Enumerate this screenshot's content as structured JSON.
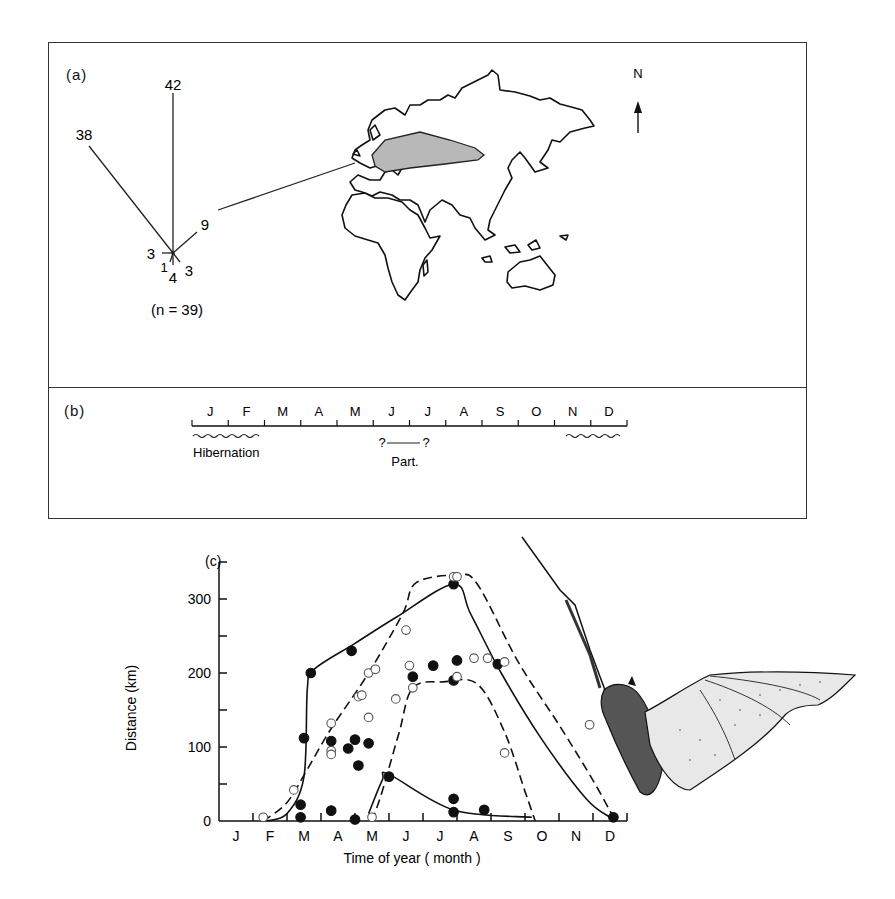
{
  "panel_a": {
    "label": "(a)",
    "rose": {
      "n_label": "(n = 39)",
      "rays": [
        {
          "direction": "N",
          "count": "42"
        },
        {
          "direction": "NW",
          "count": "38"
        },
        {
          "direction": "ENE",
          "count": "9"
        },
        {
          "direction": "W",
          "count": "3"
        },
        {
          "direction": "SSW",
          "count": "1"
        },
        {
          "direction": "S",
          "count": "4"
        },
        {
          "direction": "SE",
          "count": "3"
        }
      ]
    },
    "map": {
      "north_label": "N",
      "shaded_region": "range (Europe to Central Asia)"
    }
  },
  "panel_b": {
    "label": "(b)",
    "months": [
      "J",
      "F",
      "M",
      "A",
      "M",
      "J",
      "J",
      "A",
      "S",
      "O",
      "N",
      "D"
    ],
    "hibernation_label": "Hibernation",
    "parturition_label": "Part.",
    "parturition_marks": [
      "?",
      "?"
    ]
  },
  "panel_c": {
    "label": "(c)",
    "ylabel": "Distance (km)",
    "xlabel": "Time of year ( month )",
    "yticks": [
      "0",
      "100",
      "200",
      "300"
    ],
    "xticks": [
      "J",
      "F",
      "M",
      "A",
      "M",
      "J",
      "J",
      "A",
      "S",
      "O",
      "N",
      "D"
    ]
  },
  "chart_data": {
    "type": "scatter",
    "title": "(c)",
    "xlabel": "Time of year ( month )",
    "ylabel": "Distance (km)",
    "x_unit": "month (0 = start of Jan, 12 = end of Dec)",
    "xlim": [
      0,
      12
    ],
    "ylim": [
      0,
      350
    ],
    "categories": [
      "J",
      "F",
      "M",
      "A",
      "M",
      "J",
      "J",
      "A",
      "S",
      "O",
      "N",
      "D"
    ],
    "grid": false,
    "legend": "none",
    "series": [
      {
        "name": "filled circles",
        "marker": "filled",
        "points": [
          [
            2.7,
            200
          ],
          [
            2.5,
            112
          ],
          [
            2.4,
            22
          ],
          [
            2.4,
            5
          ],
          [
            3.3,
            108
          ],
          [
            3.3,
            14
          ],
          [
            3.9,
            230
          ],
          [
            3.8,
            98
          ],
          [
            4.0,
            110
          ],
          [
            4.1,
            75
          ],
          [
            4.4,
            105
          ],
          [
            4.0,
            2
          ],
          [
            5.0,
            60
          ],
          [
            5.7,
            195
          ],
          [
            6.3,
            210
          ],
          [
            6.9,
            190
          ],
          [
            7.0,
            217
          ],
          [
            6.9,
            320
          ],
          [
            6.9,
            12
          ],
          [
            6.9,
            30
          ],
          [
            7.8,
            15
          ],
          [
            8.2,
            212
          ],
          [
            11.6,
            5
          ]
        ]
      },
      {
        "name": "open circles",
        "marker": "open",
        "points": [
          [
            1.3,
            5
          ],
          [
            2.2,
            42
          ],
          [
            3.3,
            132
          ],
          [
            3.3,
            95
          ],
          [
            3.3,
            90
          ],
          [
            4.1,
            168
          ],
          [
            4.2,
            170
          ],
          [
            4.4,
            200
          ],
          [
            4.6,
            205
          ],
          [
            4.4,
            140
          ],
          [
            4.5,
            5
          ],
          [
            5.2,
            165
          ],
          [
            5.5,
            258
          ],
          [
            5.6,
            210
          ],
          [
            5.7,
            180
          ],
          [
            6.9,
            330
          ],
          [
            7.0,
            330
          ],
          [
            7.0,
            195
          ],
          [
            7.5,
            220
          ],
          [
            7.9,
            220
          ],
          [
            8.4,
            215
          ],
          [
            8.4,
            92
          ],
          [
            10.9,
            130
          ]
        ]
      },
      {
        "name": "solid envelope (outer)",
        "line": "solid",
        "points": [
          [
            1.4,
            0
          ],
          [
            2.0,
            10
          ],
          [
            2.5,
            60
          ],
          [
            2.6,
            180
          ],
          [
            2.8,
            205
          ],
          [
            4.0,
            240
          ],
          [
            5.2,
            275
          ],
          [
            6.9,
            320
          ],
          [
            7.4,
            280
          ],
          [
            8.3,
            200
          ],
          [
            9.5,
            110
          ],
          [
            10.8,
            30
          ],
          [
            11.5,
            5
          ]
        ]
      },
      {
        "name": "dashed envelope (outer)",
        "line": "dashed",
        "points": [
          [
            1.3,
            0
          ],
          [
            2.0,
            25
          ],
          [
            2.6,
            70
          ],
          [
            3.3,
            125
          ],
          [
            4.4,
            200
          ],
          [
            5.4,
            280
          ],
          [
            5.8,
            322
          ],
          [
            7.0,
            332
          ],
          [
            7.6,
            320
          ],
          [
            8.8,
            215
          ],
          [
            10.0,
            130
          ],
          [
            11.0,
            55
          ],
          [
            11.6,
            5
          ]
        ]
      },
      {
        "name": "dashed envelope (inner)",
        "line": "dashed",
        "points": [
          [
            4.5,
            0
          ],
          [
            4.8,
            40
          ],
          [
            5.3,
            120
          ],
          [
            5.7,
            180
          ],
          [
            6.6,
            188
          ],
          [
            7.6,
            185
          ],
          [
            8.4,
            120
          ],
          [
            9.0,
            40
          ],
          [
            9.3,
            0
          ]
        ]
      },
      {
        "name": "solid envelope (inner)",
        "line": "solid",
        "points": [
          [
            4.4,
            10
          ],
          [
            4.8,
            55
          ],
          [
            5.0,
            63
          ],
          [
            6.9,
            15
          ],
          [
            9.2,
            5
          ]
        ]
      }
    ]
  }
}
